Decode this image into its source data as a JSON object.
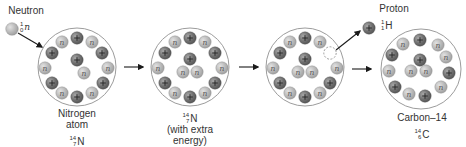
{
  "diagram": {
    "colors": {
      "proton": "#6e6e6e",
      "proton_highlight": "#9a9a9a",
      "neutron": "#b4b4b4",
      "neutron_highlight": "#d6d6d6",
      "atom_outline": "#9c9c9c",
      "arrow": "#1a1a1a"
    },
    "incoming": {
      "label": "Neutron",
      "isotope": {
        "mass": "1",
        "atomic": "0",
        "symbol": "n"
      }
    },
    "stages": [
      {
        "id": "nitrogen-atom",
        "label_lines": [
          "Nitrogen",
          "atom"
        ],
        "isotope": {
          "mass": "14",
          "atomic": "7",
          "symbol": "N"
        },
        "protons": 7,
        "neutrons": 7
      },
      {
        "id": "excited-nitrogen",
        "label_lines": [
          "(with extra",
          "energy)"
        ],
        "isotope": {
          "mass": "14",
          "atomic": "7",
          "symbol": "N"
        },
        "protons": 7,
        "neutrons": 8
      },
      {
        "id": "proton-ejection",
        "label_lines": [],
        "protons": 6,
        "neutrons": 8,
        "note": "empty proton slot (dashed)"
      },
      {
        "id": "carbon-14",
        "label_lines": [
          "Carbon–14"
        ],
        "isotope": {
          "mass": "14",
          "atomic": "6",
          "symbol": "C"
        },
        "protons": 6,
        "neutrons": 8
      }
    ],
    "outgoing": {
      "label": "Proton",
      "isotope": {
        "mass": "1",
        "atomic": "1",
        "symbol": "H"
      }
    },
    "particle_glyphs": {
      "proton": "+",
      "neutron": "n"
    }
  }
}
